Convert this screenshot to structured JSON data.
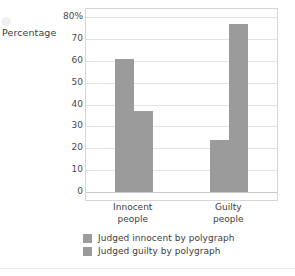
{
  "chart_data": {
    "type": "bar",
    "title": "",
    "subtitle": "",
    "xlabel": "",
    "ylabel": "Percentage",
    "ylim": [
      0,
      80
    ],
    "ytick_values": [
      80,
      70,
      60,
      50,
      40,
      30,
      20,
      10,
      0
    ],
    "ytick_labels": [
      "80%",
      "70",
      "60",
      "50",
      "40",
      "30",
      "20",
      "10",
      "0"
    ],
    "grid": true,
    "legend_position": "bottom-left",
    "categories": [
      "Innocent people",
      "Guilty people"
    ],
    "category_label_lines": [
      [
        "Innocent",
        "people"
      ],
      [
        "Guilty",
        "people"
      ]
    ],
    "series": [
      {
        "name": "Judged innocent by polygraph",
        "color": "#9b9b9b",
        "values": [
          61,
          24
        ]
      },
      {
        "name": "Judged guilty by polygraph",
        "color": "#9b9b9b",
        "values": [
          37,
          77
        ]
      }
    ]
  },
  "axis": {
    "y_title": "Percentage"
  },
  "legend": {
    "items": [
      {
        "label": "Judged innocent by polygraph",
        "color": "#9b9b9b"
      },
      {
        "label": "Judged guilty by polygraph",
        "color": "#9b9b9b"
      }
    ]
  },
  "colors": {
    "bar": "#9b9b9b",
    "gridline": "#e3e3e3",
    "baseline": "#c9c9c9",
    "frame": "#d6d6d6",
    "text": "#3d3d3d",
    "background": "#ffffff"
  }
}
